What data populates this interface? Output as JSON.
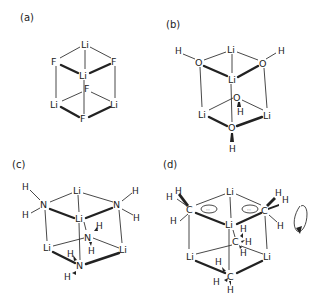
{
  "figure": {
    "panels": [
      {
        "label": "(a)",
        "species": "Li4F4 cubane",
        "atoms": {
          "li_top": "Li",
          "f_left": "F",
          "f_right": "F",
          "li_center": "Li",
          "f_inner": "F",
          "li_left": "Li",
          "li_right": "Li",
          "f_bottom": "F"
        }
      },
      {
        "label": "(b)",
        "species": "Li4(OH)4 cubane",
        "atoms": {
          "h_left": "H",
          "o_left": "O",
          "li_top": "Li",
          "o_right": "O",
          "h_right": "H",
          "li_center": "Li",
          "o_inner": "O",
          "h_inner": "H",
          "li_left": "Li",
          "li_right": "Li",
          "o_bottom": "O",
          "h_bottom": "H"
        }
      },
      {
        "label": "(c)",
        "species": "Li4(NH2)4 cubane",
        "atoms": {
          "h1": "H",
          "h2": "H",
          "n_left": "N",
          "li_top": "Li",
          "n_right": "N",
          "h3": "H",
          "h4": "H",
          "li_center": "Li",
          "n_inner": "N",
          "h5": "H",
          "h6": "H",
          "li_left": "Li",
          "li_right": "Li",
          "h7": "H",
          "n_bottom": "N",
          "h8": "H"
        }
      },
      {
        "label": "(d)",
        "species": "Li4(CH3)4 cubane",
        "atoms": {
          "c_left": "C",
          "c_right": "C",
          "li_top": "Li",
          "li_center": "Li",
          "c_inner": "C",
          "li_left": "Li",
          "li_right": "Li",
          "c_bottom": "C",
          "h": "H"
        },
        "annotations": {
          "lone_pair_symbol": "··",
          "rotation_arrow": "methyl rotation"
        }
      }
    ]
  }
}
